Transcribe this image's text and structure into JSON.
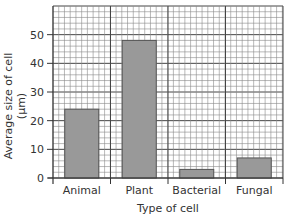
{
  "chart_data": {
    "type": "bar",
    "title": "",
    "xlabel": "Type of cell",
    "ylabel": "Average size of cell (µm)",
    "ylabel_lines": [
      "Average size of cell",
      "(µm)"
    ],
    "categories": [
      "Animal",
      "Plant",
      "Bacterial",
      "Fungal"
    ],
    "values": [
      24,
      48,
      3,
      7
    ],
    "ylim": [
      0,
      60
    ],
    "yticks": [
      0,
      10,
      20,
      30,
      40,
      50
    ],
    "grid": true,
    "grid_minor_step": 2,
    "legend": null,
    "bar_color": "#999999",
    "grid_color": "#555555"
  }
}
